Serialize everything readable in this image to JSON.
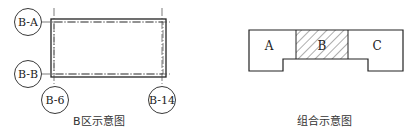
{
  "left_diagram": {
    "caption": "B区示意图",
    "axes": {
      "horizontal": [
        "B-A",
        "B-B"
      ],
      "vertical": [
        "B-6",
        "B-14"
      ]
    }
  },
  "right_diagram": {
    "caption": "组合示意图",
    "regions": [
      {
        "label": "A",
        "hatched": false
      },
      {
        "label": "B",
        "hatched": true
      },
      {
        "label": "C",
        "hatched": false
      }
    ]
  },
  "colors": {
    "line": "#222222",
    "background": "#ffffff"
  }
}
